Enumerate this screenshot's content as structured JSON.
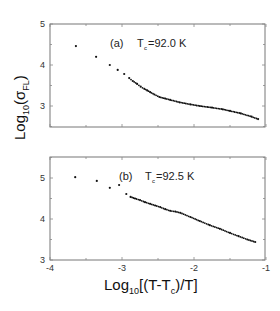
{
  "chart_data": [
    {
      "type": "scatter",
      "panel": "(a)",
      "annotation": "(a)   T_c=92.0 K",
      "label_prefix": "(a)",
      "tc_label": "=92.0 K",
      "xlabel": "Log10[(T-Tc)/T]",
      "ylabel": "Log10(σFL)",
      "xlim": [
        -4,
        -1
      ],
      "ylim": [
        2.5,
        5
      ],
      "yticks": [
        3,
        4,
        5
      ],
      "xticks": [
        -4,
        -3,
        -2,
        -1
      ],
      "grid": false,
      "x": [
        -3.64,
        -3.36,
        -3.17,
        -3.06,
        -2.97,
        -2.9,
        -2.85,
        -2.79,
        -2.74,
        -2.69,
        -2.65,
        -2.61,
        -2.55,
        -2.48,
        -2.4,
        -2.33,
        -2.2,
        -2.05,
        -1.92,
        -1.75,
        -1.6,
        -1.5,
        -1.35,
        -1.2,
        -1.11
      ],
      "y": [
        4.46,
        4.2,
        4.0,
        3.88,
        3.78,
        3.68,
        3.61,
        3.54,
        3.47,
        3.42,
        3.38,
        3.34,
        3.28,
        3.22,
        3.18,
        3.15,
        3.09,
        3.04,
        3.0,
        2.96,
        2.92,
        2.88,
        2.82,
        2.74,
        2.68
      ]
    },
    {
      "type": "scatter",
      "panel": "(b)",
      "annotation": "(b)   T_c=92.5 K",
      "label_prefix": "(b)",
      "tc_label": "=92.5 K",
      "xlabel": "Log10[(T-Tc)/T]",
      "ylabel": "Log10(σFL)",
      "xlim": [
        -4,
        -1
      ],
      "ylim": [
        3,
        5.5
      ],
      "yticks": [
        3,
        4,
        5
      ],
      "xticks": [
        -4,
        -3,
        -2,
        -1
      ],
      "grid": false,
      "x": [
        -3.65,
        -3.35,
        -3.17,
        -3.04,
        -2.94,
        -2.88,
        -2.82,
        -2.75,
        -2.68,
        -2.61,
        -2.54,
        -2.47,
        -2.4,
        -2.33,
        -2.26,
        -2.19,
        -2.05,
        -1.92,
        -1.78,
        -1.64,
        -1.5,
        -1.38,
        -1.26,
        -1.15
      ],
      "y": [
        5.02,
        4.93,
        4.76,
        4.83,
        4.61,
        4.54,
        4.5,
        4.46,
        4.41,
        4.37,
        4.33,
        4.29,
        4.24,
        4.2,
        4.18,
        4.15,
        4.05,
        3.95,
        3.85,
        3.76,
        3.66,
        3.58,
        3.5,
        3.44
      ]
    }
  ],
  "labels": {
    "y_axis_main": "Log",
    "y_axis_sub": "10",
    "y_axis_paren": "(σ",
    "y_axis_sub2": "FL",
    "y_axis_close": ")",
    "x_axis_main": "Log",
    "x_axis_sub": "10",
    "x_axis_mid": "[(T-T",
    "x_axis_sub2": "c",
    "x_axis_end": ")/T]",
    "tc_T": "T",
    "tc_sub": "c",
    "xtick_labels": [
      "-4",
      "-3",
      "-2",
      "-1"
    ],
    "ytick_labels": [
      "3",
      "4",
      "5"
    ],
    "panel_a_label": "(a)",
    "panel_a_tc": "=92.0 K",
    "panel_b_label": "(b)",
    "panel_b_tc": "=92.5 K"
  }
}
